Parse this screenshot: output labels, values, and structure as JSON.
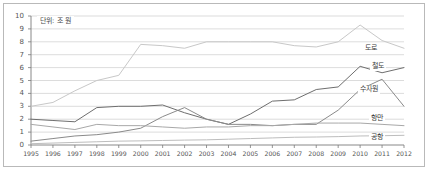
{
  "chart_data": {
    "type": "line",
    "title": "",
    "subtitle": "",
    "unit_note": "단위: 조 원",
    "xlabel": "",
    "ylabel": "",
    "grid": true,
    "legend_position": "inline-right",
    "xlim": [
      1995,
      2012
    ],
    "ylim": [
      0,
      10
    ],
    "ytick_step": 1,
    "categories": [
      "1995",
      "1996",
      "1997",
      "1998",
      "1999",
      "2000",
      "2001",
      "2002",
      "2003",
      "2004",
      "2005",
      "2006",
      "2007",
      "2008",
      "2009",
      "2010",
      "2011",
      "2012"
    ],
    "yticks": [
      "0",
      "1",
      "2",
      "3",
      "4",
      "5",
      "6",
      "7",
      "8",
      "9",
      "10"
    ],
    "series": [
      {
        "name": "도로",
        "label": "도로",
        "color": "#c8c8c8",
        "values": [
          3.0,
          3.3,
          4.2,
          5.0,
          5.4,
          7.8,
          7.7,
          7.5,
          8.0,
          8.0,
          8.0,
          8.0,
          7.7,
          7.6,
          8.0,
          9.3,
          8.1,
          7.5
        ]
      },
      {
        "name": "철도",
        "label": "철도",
        "color": "#6e6e6e",
        "values": [
          2.0,
          1.9,
          1.8,
          2.9,
          3.0,
          3.0,
          3.1,
          2.5,
          2.0,
          1.6,
          2.4,
          3.4,
          3.5,
          4.3,
          4.5,
          6.1,
          5.6,
          6.0
        ]
      },
      {
        "name": "수자원",
        "label": "수자원",
        "color": "#8a8a8a",
        "values": [
          0.3,
          0.5,
          0.7,
          0.8,
          1.0,
          1.3,
          2.2,
          2.9,
          2.0,
          1.6,
          1.6,
          1.5,
          1.6,
          1.6,
          2.7,
          4.3,
          5.1,
          3.0
        ]
      },
      {
        "name": "항만",
        "label": "항만",
        "color": "#a8a8a8",
        "values": [
          1.6,
          1.4,
          1.2,
          1.6,
          1.5,
          1.5,
          1.4,
          1.3,
          1.4,
          1.4,
          1.5,
          1.5,
          1.6,
          1.7,
          1.7,
          1.7,
          1.6,
          1.5
        ]
      },
      {
        "name": "공항",
        "label": "공항",
        "color": "#bdbdbd",
        "values": [
          0.1,
          0.15,
          0.2,
          0.25,
          0.3,
          0.32,
          0.35,
          0.38,
          0.4,
          0.45,
          0.5,
          0.55,
          0.6,
          0.62,
          0.65,
          0.7,
          0.72,
          0.75
        ]
      }
    ],
    "series_label_positions": [
      {
        "name": "도로",
        "x": 363,
        "y": 44
      },
      {
        "name": "철도",
        "x": 370,
        "y": 62
      },
      {
        "name": "수자원",
        "x": 358,
        "y": 85
      },
      {
        "name": "항만",
        "x": 369,
        "y": 114
      },
      {
        "name": "공항",
        "x": 369,
        "y": 133
      }
    ],
    "plot_geometry": {
      "left": 31,
      "right": 404,
      "top": 16,
      "bottom": 145
    }
  }
}
